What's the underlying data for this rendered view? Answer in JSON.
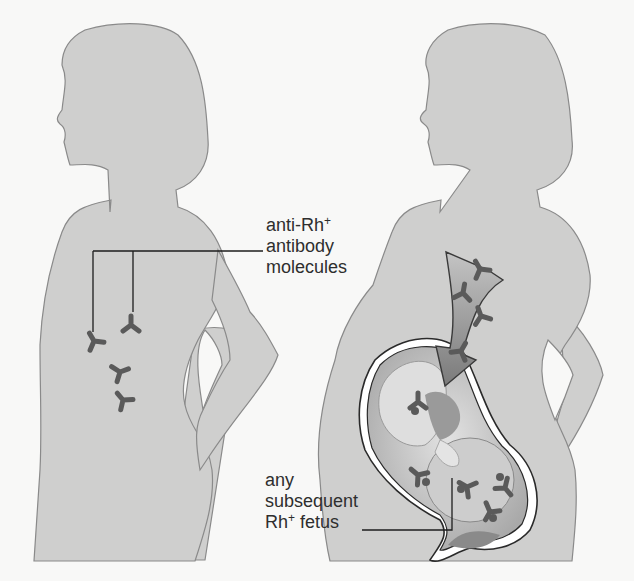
{
  "figure": {
    "panels": [
      {
        "id": "left",
        "subject": "mother silhouette with circulating antibodies"
      },
      {
        "id": "right",
        "subject": "pregnant mother with antibodies crossing to fetus"
      }
    ],
    "labels": {
      "antibody": {
        "line1": "anti-Rh",
        "line1_sup": "+",
        "line2": "antibody",
        "line3": "molecules"
      },
      "fetus": {
        "line1": "any",
        "line2": "subsequent",
        "line3_main": "Rh",
        "line3_sup": "+",
        "line3_rest": " fetus"
      }
    },
    "colors": {
      "background": "#f8f8f7",
      "silhouette_fill": "#cfcfce",
      "silhouette_stroke": "#8a8a8a",
      "antibody": "#5a5a5a",
      "arrow_fill": "#8c8c8c",
      "arrow_stroke": "#3a3a3a",
      "leader_line": "#1e1e1e",
      "text": "#2e2e2e"
    }
  }
}
